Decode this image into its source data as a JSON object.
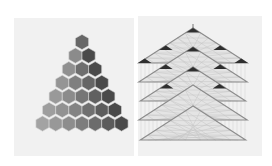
{
  "figure": {
    "left_panel": {
      "label": "hexagonal pyramid",
      "rows": 7,
      "hex_size": 7.6,
      "apex": [
        82,
        42
      ],
      "row_spacing": 13.6,
      "colors": {
        "light": "#b4b4b4",
        "mid": "#8a8a8a",
        "dark": "#5a5a5a",
        "darkest": "#4a4a4a",
        "stroke": "#d8d8d8"
      }
    },
    "right_panel": {
      "label": "stacked triangular lattices",
      "layers": [
        {
          "apex": [
            193,
            28
          ],
          "base_y": 63,
          "half_width": 54
        },
        {
          "apex": [
            193,
            47
          ],
          "base_y": 82,
          "half_width": 54
        },
        {
          "apex": [
            193,
            67
          ],
          "base_y": 101,
          "half_width": 54
        },
        {
          "apex": [
            193,
            85
          ],
          "base_y": 120,
          "half_width": 54
        },
        {
          "apex": [
            193,
            106
          ],
          "base_y": 140,
          "half_width": 54
        }
      ],
      "colors": {
        "line": "#8c8c8c",
        "fill": "#e4e4e4",
        "mesh": "#c4c4c4",
        "accent": "#2e2e2e",
        "vertical": "#d0d0d0"
      }
    }
  }
}
